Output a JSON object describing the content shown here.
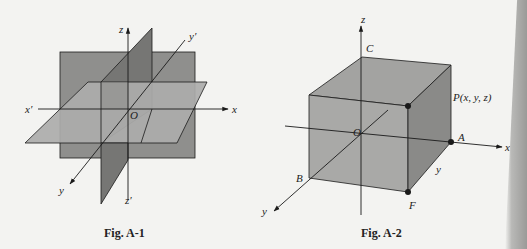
{
  "figures": [
    {
      "id": "fig-a1",
      "caption": "Fig. A-1",
      "labels": {
        "z": "z",
        "z_prime": "z′",
        "x": "x",
        "x_prime": "x′",
        "y": "y",
        "y_prime": "y′",
        "origin": "O"
      },
      "description": "Three mutually perpendicular coordinate planes (xy, xz, yz) intersecting at origin O"
    },
    {
      "id": "fig-a2",
      "caption": "Fig. A-2",
      "labels": {
        "z": "z",
        "x": "x",
        "y_axis": "y",
        "y_edge": "y",
        "origin": "O",
        "point_c": "C",
        "point_p": "P(x, y, z)",
        "point_a": "A",
        "point_b": "B",
        "point_f": "F"
      },
      "description": "Rectangular box with one vertex at origin O and opposite vertex at point P(x, y, z)"
    }
  ],
  "colors": {
    "background": "#f3f3f1",
    "plane_light": "#a9a9a7",
    "plane_medium": "#8f8f8d",
    "plane_dark": "#767674",
    "line": "#1a1a1a"
  }
}
